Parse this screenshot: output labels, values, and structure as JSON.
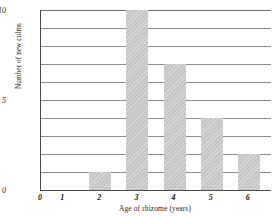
{
  "chart_data": {
    "type": "bar",
    "title": "",
    "xlabel": "Age of rhizome (years)",
    "ylabel": "Number of new culms",
    "categories": [
      "1",
      "2",
      "3",
      "4",
      "5",
      "6"
    ],
    "values": [
      0,
      1,
      10,
      7,
      4,
      2
    ],
    "xlim": [
      0.4,
      6.6
    ],
    "ylim": [
      0,
      10
    ],
    "y_ticks": [
      "0",
      "5",
      "10"
    ],
    "y_tick_values": [
      0,
      5,
      10
    ],
    "y_gridline_values": [
      1,
      2,
      3,
      4,
      5,
      6,
      7,
      8,
      9,
      10
    ],
    "x_ticks": [
      "1",
      "2",
      "3",
      "4",
      "5",
      "6"
    ],
    "x_origin_label": "0",
    "grid": true,
    "legend": false,
    "bar_color": "#c6c6c6",
    "axis_color": "#4a4a4a",
    "grid_color": "#8d8d8d"
  }
}
